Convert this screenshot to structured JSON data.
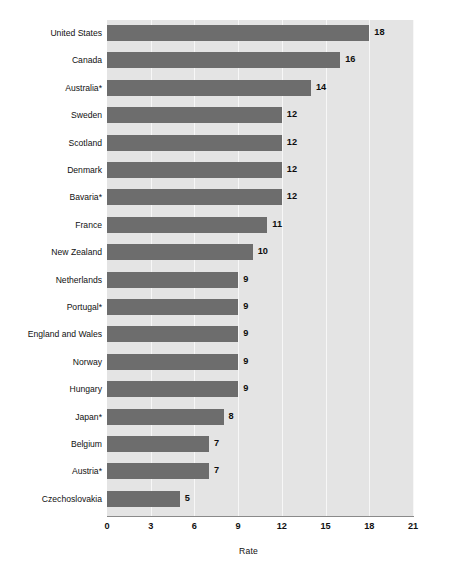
{
  "chart_data": {
    "type": "bar",
    "orientation": "horizontal",
    "title": "",
    "xlabel": "Rate",
    "ylabel": "",
    "xlim": [
      0,
      21
    ],
    "xticks": [
      0,
      3,
      6,
      9,
      12,
      15,
      18,
      21
    ],
    "grid": true,
    "legend": null,
    "categories": [
      "United States",
      "Canada",
      "Australia*",
      "Sweden",
      "Scotland",
      "Denmark",
      "Bavaria*",
      "France",
      "New Zealand",
      "Netherlands",
      "Portugal*",
      "England and Wales",
      "Norway",
      "Hungary",
      "Japan*",
      "Belgium",
      "Austria*",
      "Czechoslovakia"
    ],
    "values": [
      18,
      16,
      14,
      12,
      12,
      12,
      12,
      11,
      10,
      9,
      9,
      9,
      9,
      9,
      8,
      7,
      7,
      5
    ],
    "value_labels": [
      "18",
      "16",
      "14",
      "12",
      "12",
      "12",
      "12",
      "11",
      "10",
      "9",
      "9",
      "9",
      "9",
      "9",
      "8",
      "7",
      "7",
      "5"
    ]
  },
  "colors": {
    "bar": "#6d6d6d",
    "plot_background": "#e4e4e4",
    "gridline": "#f7f7f7",
    "axis_line": "#8a8a8a",
    "text": "#111111",
    "page_background": "#ffffff"
  }
}
